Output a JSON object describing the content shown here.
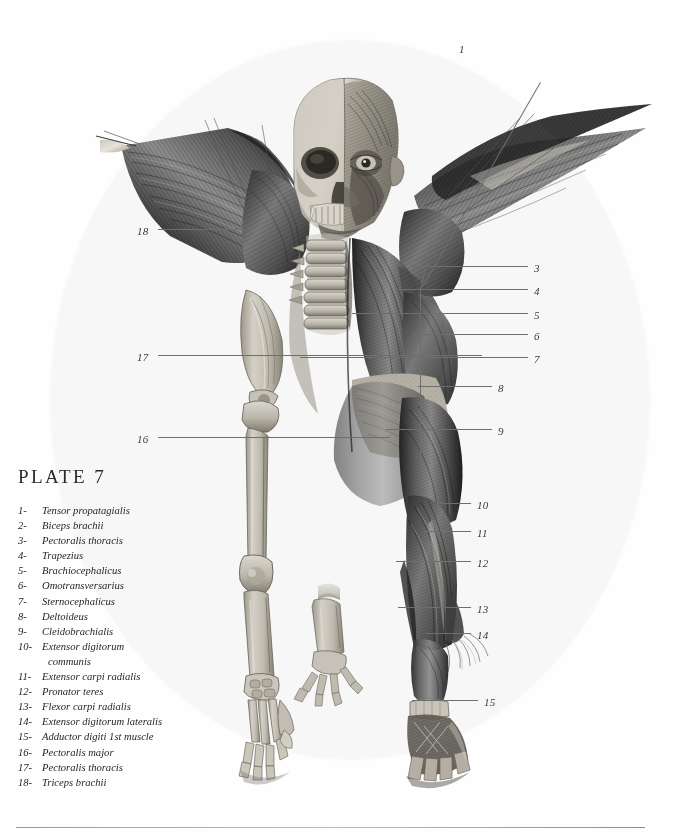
{
  "plate": {
    "title": "PLATE 7"
  },
  "legend": {
    "items": [
      {
        "num": "1-",
        "label": "Tensor propatagialis"
      },
      {
        "num": "2-",
        "label": "Biceps brachii"
      },
      {
        "num": "3-",
        "label": "Pectoralis thoracis"
      },
      {
        "num": "4-",
        "label": "Trapezius"
      },
      {
        "num": "5-",
        "label": "Brachiocephalicus"
      },
      {
        "num": "6-",
        "label": "Omotransversarius"
      },
      {
        "num": "7-",
        "label": "Sternocephalicus"
      },
      {
        "num": "8-",
        "label": "Deltoideus"
      },
      {
        "num": "9-",
        "label": "Cleidobrachialis"
      },
      {
        "num": "10-",
        "label": "Extensor digitorum",
        "continuation": "communis"
      },
      {
        "num": "11-",
        "label": "Extensor carpi radialis"
      },
      {
        "num": "12-",
        "label": "Pronator teres"
      },
      {
        "num": "13-",
        "label": "Flexor carpi radialis"
      },
      {
        "num": "14-",
        "label": "Extensor digitorum lateralis"
      },
      {
        "num": "15-",
        "label": "Adductor digiti 1st muscle"
      },
      {
        "num": "16-",
        "label": "Pectoralis major"
      },
      {
        "num": "17-",
        "label": "Pectoralis thoracis"
      },
      {
        "num": "18-",
        "label": "Triceps brachii"
      }
    ]
  },
  "callouts": [
    {
      "id": "1",
      "text": "1",
      "x": 459,
      "y": 43
    },
    {
      "id": "3",
      "text": "3",
      "x": 534,
      "y": 262
    },
    {
      "id": "4",
      "text": "4",
      "x": 534,
      "y": 285
    },
    {
      "id": "5",
      "text": "5",
      "x": 534,
      "y": 309
    },
    {
      "id": "6",
      "text": "6",
      "x": 534,
      "y": 330
    },
    {
      "id": "7",
      "text": "7",
      "x": 534,
      "y": 353
    },
    {
      "id": "8",
      "text": "8",
      "x": 498,
      "y": 382
    },
    {
      "id": "9",
      "text": "9",
      "x": 498,
      "y": 425
    },
    {
      "id": "10",
      "text": "10",
      "x": 477,
      "y": 500
    },
    {
      "id": "11",
      "text": "11",
      "x": 477,
      "y": 528
    },
    {
      "id": "12",
      "text": "12",
      "x": 477,
      "y": 558
    },
    {
      "id": "13",
      "text": "13",
      "x": 477,
      "y": 604
    },
    {
      "id": "14",
      "text": "14",
      "x": 477,
      "y": 630
    },
    {
      "id": "15",
      "text": "15",
      "x": 484,
      "y": 697
    },
    {
      "id": "16",
      "text": "16",
      "x": 137,
      "y": 434
    },
    {
      "id": "17",
      "text": "17",
      "x": 137,
      "y": 352
    },
    {
      "id": "18",
      "text": "18",
      "x": 137,
      "y": 226
    }
  ],
  "colors": {
    "ink": "#1f1f1f",
    "leader": "#6e6e6e",
    "paper": "#fefefe",
    "bone_light": "#d8d4cb",
    "bone_mid": "#b3ad a1",
    "muscle_dark": "#2e2e2e",
    "muscle_mid": "#6b6b6b"
  },
  "figure": {
    "caption_name": "anatomical-plate-winged-figure"
  }
}
